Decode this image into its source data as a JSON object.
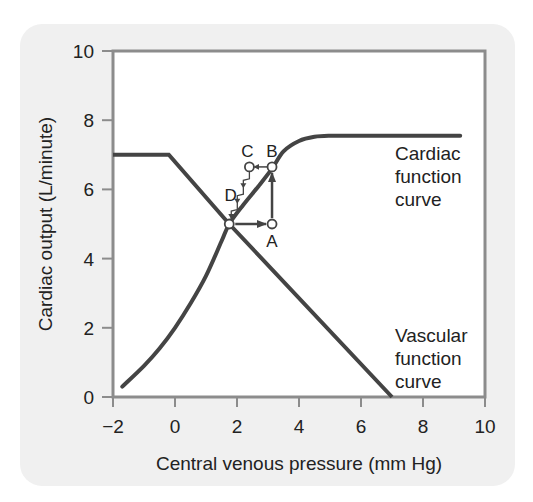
{
  "chart_data": {
    "type": "line",
    "title": "",
    "xlabel": "Central venous pressure (mm Hg)",
    "ylabel": "Cardiac output (L/minute)",
    "xlim": [
      -2,
      10
    ],
    "ylim": [
      0,
      10
    ],
    "xticks": [
      -2,
      0,
      2,
      4,
      6,
      8,
      10
    ],
    "yticks": [
      0,
      2,
      4,
      6,
      8,
      10
    ],
    "xtick_labels": [
      "−2",
      "0",
      "2",
      "4",
      "6",
      "8",
      "10"
    ],
    "ytick_labels": [
      "0",
      "2",
      "4",
      "6",
      "8",
      "10"
    ],
    "grid": false,
    "series": [
      {
        "name": "Cardiac function curve",
        "label_lines": [
          "Cardiac",
          "function",
          "curve"
        ],
        "x": [
          -1.7,
          -1.0,
          -0.5,
          0.0,
          0.5,
          1.0,
          1.5,
          1.75,
          2.2,
          2.7,
          3.13,
          3.5,
          4.0,
          4.5,
          5.0,
          6.0,
          7.0,
          8.0,
          9.2
        ],
        "values": [
          0.3,
          0.9,
          1.4,
          2.0,
          2.7,
          3.5,
          4.5,
          5.0,
          5.55,
          6.1,
          6.6,
          7.1,
          7.4,
          7.52,
          7.55,
          7.55,
          7.55,
          7.55,
          7.55
        ]
      },
      {
        "name": "Vascular function curve",
        "label_lines": [
          "Vascular",
          "function",
          "curve"
        ],
        "x": [
          -2.0,
          -0.2,
          1.75,
          7.0
        ],
        "values": [
          7.0,
          7.0,
          5.0,
          0.0
        ]
      }
    ],
    "annotations": [
      {
        "label": "",
        "name": "equilibrium",
        "x": 1.75,
        "y": 5.0
      },
      {
        "label": "A",
        "x": 3.13,
        "y": 5.0
      },
      {
        "label": "B",
        "x": 3.13,
        "y": 6.65
      },
      {
        "label": "C",
        "x": 2.4,
        "y": 6.65
      },
      {
        "label": "D",
        "x": 2.05,
        "y": 5.85
      }
    ],
    "arrows": [
      {
        "from": "equilibrium",
        "to": "A",
        "direction": "right"
      },
      {
        "from": "A",
        "to": "B",
        "direction": "up"
      },
      {
        "from": "B",
        "to": "C",
        "direction": "left"
      },
      {
        "from": "C",
        "to": "equilibrium",
        "direction": "stepwise-down"
      }
    ],
    "legend": "inline text labels at right"
  },
  "colors": {
    "panel": "#f0f0f0",
    "frame": "#8c8c8c",
    "curve": "#444444",
    "text": "#222222"
  }
}
